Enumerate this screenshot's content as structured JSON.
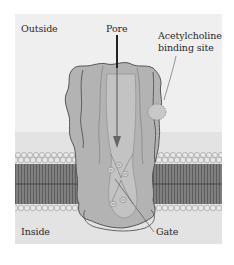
{
  "diagram": {
    "labels": {
      "outside": "Outside",
      "inside": "Inside",
      "pore": "Pore",
      "binding_site_line1": "Acetylcholine",
      "binding_site_line2": "binding site",
      "gate": "Gate"
    },
    "colors": {
      "background_outside": "#efefef",
      "background_inside": "#e2e2e2",
      "protein_fill": "#b5b5b5",
      "protein_inner": "#c4c4c4",
      "protein_outline": "#555555",
      "lipid_head": "#e6e6e6",
      "lipid_tail": "#5a5a5a",
      "arrow": "#333333"
    }
  }
}
